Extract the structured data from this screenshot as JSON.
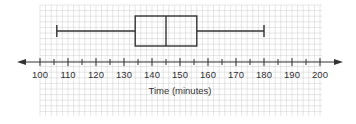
{
  "chart_data": {
    "type": "boxplot",
    "title": "",
    "xlabel": "Time (minutes)",
    "ylabel": "",
    "xlim": [
      100,
      200
    ],
    "x_ticks": [
      100,
      110,
      120,
      130,
      140,
      150,
      160,
      170,
      180,
      190,
      200
    ],
    "minor_tick_step": 5,
    "grid": true,
    "legend": null,
    "orientation": "horizontal",
    "box": {
      "min": 106,
      "q1": 134,
      "median": 145,
      "q3": 156,
      "max": 180
    },
    "colors": {
      "line": "#333333",
      "grid": "#cccccc",
      "background": "#ffffff"
    }
  }
}
